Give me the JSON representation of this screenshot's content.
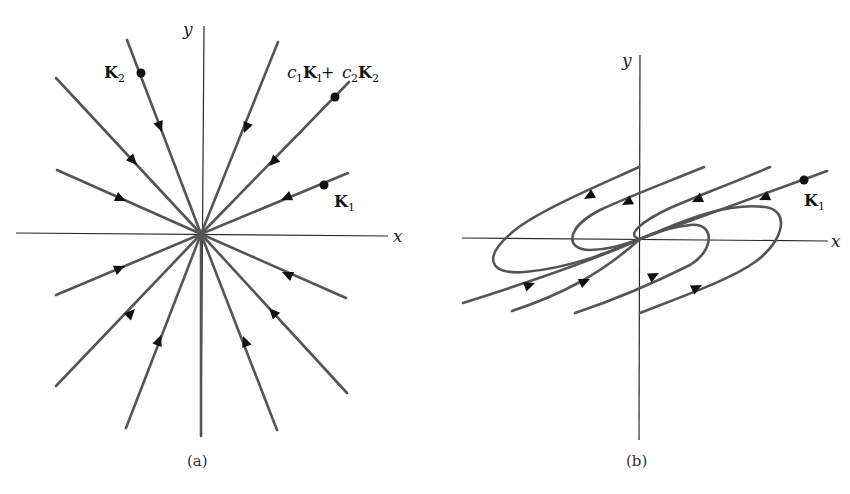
{
  "figure": {
    "panel_a": {
      "caption": "(a)",
      "x_axis_label": "x",
      "y_axis_label": "y",
      "labels": {
        "k2": "K",
        "k2_sub": "2",
        "k1": "K",
        "k1_sub": "1",
        "combo_c1": "c",
        "combo_c1_sub": "1",
        "combo_k1": "K",
        "combo_k1_sub": "1",
        "combo_plus": " + ",
        "combo_c2": "c",
        "combo_c2_sub": "2",
        "combo_k2": "K",
        "combo_k2_sub": "2"
      },
      "description": "Star node: straight-line trajectories all directed into the origin"
    },
    "panel_b": {
      "caption": "(b)",
      "x_axis_label": "x",
      "y_axis_label": "y",
      "labels": {
        "k1": "K",
        "k1_sub": "1"
      },
      "description": "Degenerate node: trajectories approach origin tangent to K1 direction"
    },
    "colors": {
      "trajectory": "#555555",
      "axis": "#2a2a2a",
      "arrow": "#111111"
    }
  }
}
